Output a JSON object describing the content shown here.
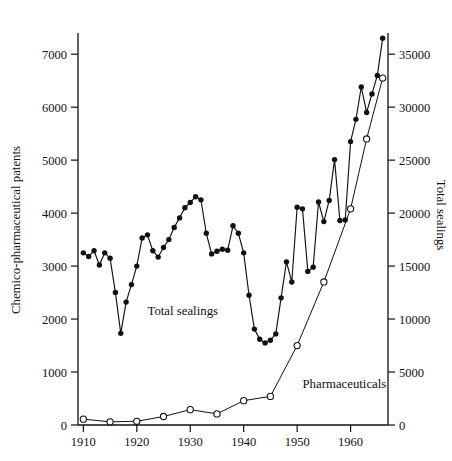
{
  "chart_data": {
    "type": "line",
    "title": "",
    "subtitle": "",
    "xlabel": "",
    "ylabel": "Chemico-pharmaceutical patents",
    "y2label": "Total sealings",
    "xlim": [
      1909,
      1967
    ],
    "ylim": [
      0,
      7400
    ],
    "y2lim": [
      0,
      37000
    ],
    "grid": false,
    "legend_position": "inline-annotation",
    "x_ticks": [
      1910,
      1920,
      1930,
      1940,
      1950,
      1960
    ],
    "x_tick_labels": [
      "1910",
      "1920",
      "1930",
      "1940",
      "1950",
      "1960"
    ],
    "y_ticks": [
      0,
      1000,
      2000,
      3000,
      4000,
      5000,
      6000,
      7000
    ],
    "y_tick_labels": [
      "0",
      "1000",
      "2000",
      "3000",
      "4000",
      "5000",
      "6000",
      "7000"
    ],
    "y2_ticks": [
      0,
      5000,
      10000,
      15000,
      20000,
      25000,
      30000,
      35000
    ],
    "y2_tick_labels": [
      "0",
      "5000",
      "10000",
      "15000",
      "20000",
      "25000",
      "30000",
      "35000"
    ],
    "annotations": [
      {
        "text": "Total sealings",
        "x": 1922,
        "y": 2080,
        "axis": "left"
      },
      {
        "text": "Pharmaceuticals",
        "x": 1951,
        "y": 690,
        "axis": "left"
      }
    ],
    "series": [
      {
        "name": "Total sealings",
        "axis": "right",
        "marker": "filled-circle",
        "x": [
          1910,
          1911,
          1912,
          1913,
          1914,
          1915,
          1916,
          1917,
          1918,
          1919,
          1920,
          1921,
          1922,
          1923,
          1924,
          1925,
          1926,
          1927,
          1928,
          1929,
          1930,
          1931,
          1932,
          1933,
          1934,
          1935,
          1936,
          1937,
          1938,
          1939,
          1940,
          1941,
          1942,
          1943,
          1944,
          1945,
          1946,
          1947,
          1948,
          1949,
          1950,
          1951,
          1952,
          1953,
          1954,
          1955,
          1956,
          1957,
          1958,
          1959,
          1960,
          1961,
          1962,
          1963,
          1964,
          1965,
          1966
        ],
        "values": [
          3250,
          3180,
          3290,
          3020,
          3250,
          3150,
          2500,
          1730,
          2320,
          2650,
          3000,
          3530,
          3590,
          3290,
          3170,
          3350,
          3500,
          3730,
          3910,
          4100,
          4200,
          4310,
          4250,
          3620,
          3230,
          3280,
          3320,
          3300,
          3760,
          3620,
          3250,
          2450,
          1810,
          1620,
          1550,
          1600,
          1720,
          2400,
          3080,
          2700,
          4110,
          4080,
          2900,
          2980,
          4210,
          3840,
          4240,
          5010,
          3860,
          3870,
          5350,
          5770,
          6380,
          5900,
          6250,
          6600,
          7300
        ],
        "values_right_axis": [
          16250,
          15900,
          16450,
          15100,
          16250,
          15750,
          12500,
          8650,
          11600,
          13250,
          15000,
          17650,
          17950,
          16450,
          15850,
          16750,
          17500,
          18650,
          19550,
          20500,
          21000,
          21550,
          21250,
          18100,
          16150,
          16400,
          16600,
          16500,
          18800,
          18100,
          16250,
          12250,
          9050,
          8100,
          7750,
          8000,
          8600,
          12000,
          15400,
          13500,
          20550,
          20400,
          14500,
          14900,
          21050,
          19200,
          21200,
          25050,
          19300,
          19350,
          26750,
          28850,
          31900,
          29500,
          31250,
          33000,
          36500
        ]
      },
      {
        "name": "Pharmaceuticals",
        "axis": "left",
        "marker": "open-circle",
        "x": [
          1910,
          1915,
          1920,
          1925,
          1930,
          1935,
          1940,
          1945,
          1950,
          1955,
          1960,
          1963,
          1966
        ],
        "values": [
          110,
          60,
          70,
          160,
          290,
          210,
          460,
          540,
          1500,
          2700,
          4080,
          5400,
          6550
        ]
      }
    ]
  }
}
